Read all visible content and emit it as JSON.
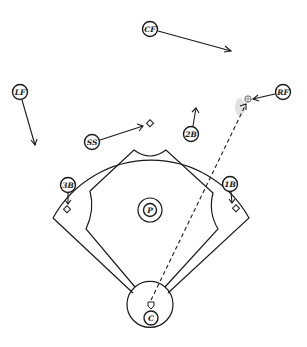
{
  "diagram": {
    "type": "baseball-field-positions",
    "colors": {
      "ink": "#1a1a1a",
      "background": "#ffffff",
      "smudge": "#d9d9d9"
    },
    "players": [
      {
        "id": "cf",
        "label": "CF",
        "x": 150,
        "y": 29,
        "arrow_to": [
          231,
          51
        ]
      },
      {
        "id": "lf",
        "label": "LF",
        "x": 20,
        "y": 92,
        "arrow_to": [
          35,
          145
        ]
      },
      {
        "id": "rf",
        "label": "RF",
        "x": 283,
        "y": 92,
        "arrow_to": [
          253,
          99
        ]
      },
      {
        "id": "ss",
        "label": "SS",
        "x": 92,
        "y": 142,
        "arrow_to": [
          143,
          126
        ]
      },
      {
        "id": "2b",
        "label": "2B",
        "x": 191,
        "y": 134,
        "arrow_to": [
          196,
          108
        ]
      },
      {
        "id": "3b",
        "label": "3B",
        "x": 68,
        "y": 185,
        "arrow_to": [
          68,
          204
        ]
      },
      {
        "id": "1b",
        "label": "1B",
        "x": 230,
        "y": 184,
        "arrow_to": [
          232,
          203
        ]
      },
      {
        "id": "p",
        "label": "P",
        "x": 150,
        "y": 210
      },
      {
        "id": "c",
        "label": "C",
        "x": 151,
        "y": 318
      }
    ],
    "bases": {
      "second": [
        150,
        124
      ],
      "third": [
        67,
        210
      ],
      "first": [
        236,
        209
      ],
      "home": [
        151,
        305
      ]
    },
    "ball": {
      "x": 248,
      "y": 99
    },
    "throw_line": {
      "from": [
        151,
        300
      ],
      "to": [
        246,
        104
      ],
      "style": "dashed"
    }
  }
}
